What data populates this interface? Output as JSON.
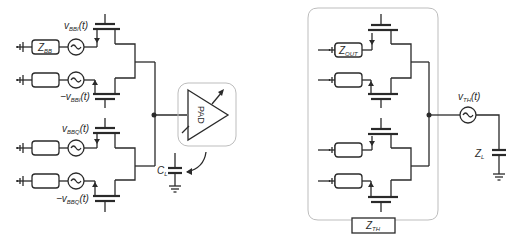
{
  "left_circuit": {
    "labels": {
      "vbbi": {
        "main": "v",
        "sub": "BBI",
        "tail": "(t)"
      },
      "neg_vbbi": {
        "main": "−v",
        "sub": "BBI",
        "tail": "(t)"
      },
      "vbbq": {
        "main": "v",
        "sub": "BBQ",
        "tail": "(t)"
      },
      "neg_vbbq": {
        "main": "−v",
        "sub": "BBQ",
        "tail": "(t)"
      },
      "zbb": {
        "main": "Z",
        "sub": "BB"
      },
      "cl": {
        "main": "C",
        "sub": "L"
      },
      "pad": "PAD"
    }
  },
  "right_circuit": {
    "labels": {
      "zout": {
        "main": "Z",
        "sub": "OUT"
      },
      "vth": {
        "main": "v",
        "sub": "TH",
        "tail": "(t)"
      },
      "zl": {
        "main": "Z",
        "sub": "L"
      },
      "zth": {
        "main": "Z",
        "sub": "TH"
      }
    }
  },
  "colors": {
    "wire": "#2a2a2a",
    "group_outline": "#bdbdbd"
  }
}
